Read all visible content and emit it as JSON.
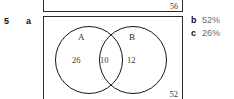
{
  "question": {
    "number": "5",
    "part_a_letter": "a"
  },
  "previous_question": {
    "outside_count": "56"
  },
  "venn": {
    "set_a_label": "A",
    "set_b_label": "B",
    "only_a": "26",
    "intersection": "10",
    "only_b": "12",
    "outside": "52"
  },
  "answers": [
    {
      "letter": "b",
      "value": "52%"
    },
    {
      "letter": "c",
      "value": "26%"
    }
  ],
  "colors": {
    "ink": "#1a1a1a",
    "rule": "#2b2b2b",
    "answer_text": "#6b6b6b"
  }
}
